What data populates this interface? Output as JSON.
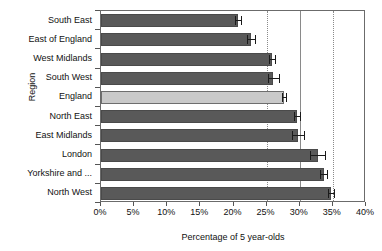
{
  "chart_data": {
    "type": "bar",
    "orientation": "horizontal",
    "title": "",
    "xlabel": "Percentage of 5 year-olds",
    "ylabel": "Region",
    "xlim": [
      0,
      40
    ],
    "xtick_labels": [
      "0%",
      "5%",
      "10%",
      "15%",
      "20%",
      "25%",
      "30%",
      "35%",
      "40%"
    ],
    "xtick_values": [
      0,
      5,
      10,
      15,
      20,
      25,
      30,
      35,
      40
    ],
    "grid": "vertical dotted gridlines at 25%, 30%, 35%",
    "legend": "none",
    "categories": [
      "South East",
      "East of England",
      "West Midlands",
      "South West",
      "England",
      "North East",
      "East Midlands",
      "London",
      "Yorkshire and ...",
      "North West"
    ],
    "values": [
      20.7,
      22.6,
      25.8,
      26.0,
      27.6,
      29.6,
      29.7,
      32.7,
      33.6,
      34.7
    ],
    "error_low": [
      0.5,
      0.6,
      0.5,
      0.8,
      0.3,
      0.4,
      0.9,
      1.1,
      0.5,
      0.4
    ],
    "error_high": [
      0.5,
      0.6,
      0.5,
      0.8,
      0.3,
      0.4,
      0.9,
      1.1,
      0.5,
      0.4
    ],
    "highlight_category": "England",
    "colors": {
      "bar": "#595959",
      "highlight_bar": "#c9c9c9",
      "error_bar": "#1a1a1a",
      "gridline": "#8a8a8a",
      "axis": "#6b6b6b",
      "background": "#ffffff",
      "text": "#111111"
    }
  }
}
